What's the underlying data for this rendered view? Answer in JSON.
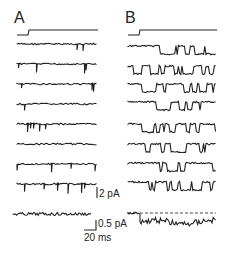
{
  "figure": {
    "panels": [
      {
        "label": "A",
        "traces": 9,
        "activity": "sparse brief openings",
        "has_voltage_step": true,
        "has_average_trace": true
      },
      {
        "label": "B",
        "traces": 9,
        "activity": "frequent long openings",
        "has_voltage_step": true,
        "has_average_trace": true,
        "average_trace_baseline_dashed": true
      }
    ],
    "scale_bars": {
      "current_single": "2 pA",
      "current_average": "0.5 pA",
      "time": "20 ms"
    }
  },
  "text": {
    "panel_a": "A",
    "panel_b": "B",
    "scale_2pa": "2 pA",
    "scale_05pa": "0.5 pA",
    "scale_20ms": "20 ms"
  }
}
